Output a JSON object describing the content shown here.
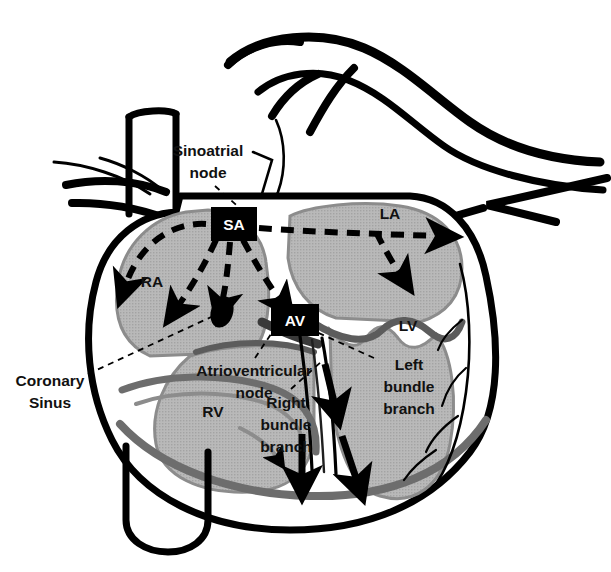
{
  "diagram": {
    "type": "anatomical-illustration",
    "background_color": "#ffffff",
    "outline_color": "#000000",
    "muscle_fill_color": "#b3b3b3",
    "muscle_shade_color": "#8a8a8a",
    "node_box_color": "#000000",
    "node_text_color": "#ffffff"
  },
  "nodes": [
    {
      "id": "sa",
      "label": "SA",
      "x": 211,
      "y": 207,
      "w": 46,
      "h": 34
    },
    {
      "id": "av",
      "label": "AV",
      "x": 271,
      "y": 304,
      "w": 48,
      "h": 32
    }
  ],
  "chambers": [
    {
      "id": "ra",
      "label": "RA",
      "x": 152,
      "y": 281
    },
    {
      "id": "la",
      "label": "LA",
      "x": 390,
      "y": 213
    },
    {
      "id": "rv",
      "label": "RV",
      "x": 213,
      "y": 411
    },
    {
      "id": "lv",
      "label": "LV",
      "x": 408,
      "y": 325
    }
  ],
  "annotations": [
    {
      "id": "sinoatrial-node",
      "lines": [
        "Sinoatrial",
        "node"
      ],
      "x": 208,
      "y": 155,
      "anchor": "middle"
    },
    {
      "id": "coronary-sinus",
      "lines": [
        "Coronary",
        "Sinus"
      ],
      "x": 50,
      "y": 385,
      "anchor": "middle"
    },
    {
      "id": "atrioventricular-node",
      "lines": [
        "Atrioventricular",
        "node"
      ],
      "x": 254,
      "y": 375,
      "anchor": "middle"
    },
    {
      "id": "right-bundle-branch",
      "lines": [
        "Right",
        "bundle",
        "branch"
      ],
      "x": 286,
      "y": 406,
      "anchor": "middle"
    },
    {
      "id": "left-bundle-branch",
      "lines": [
        "Left",
        "bundle",
        "branch"
      ],
      "x": 409,
      "y": 368,
      "anchor": "middle"
    }
  ],
  "leaders": [
    {
      "id": "leader-sinoatrial",
      "from": [
        215,
        186
      ],
      "to": [
        243,
        211
      ]
    },
    {
      "id": "leader-coronary-sinus",
      "from": [
        88,
        374
      ],
      "to": [
        222,
        312
      ]
    },
    {
      "id": "leader-atrioventricular",
      "from": [
        255,
        358
      ],
      "to": [
        277,
        325
      ]
    },
    {
      "id": "leader-right-bundle",
      "from": [
        291,
        389
      ],
      "to": [
        321,
        362
      ]
    },
    {
      "id": "leader-left-bundle",
      "from": [
        374,
        358
      ],
      "to": [
        312,
        330
      ]
    }
  ],
  "conduction_arrows": {
    "dashed_description": "Internodal and interatrial dashed conduction pathways radiating from the SA node",
    "solid_description": "Solid black arrows tracing the bundle branches down the interventricular septum"
  }
}
